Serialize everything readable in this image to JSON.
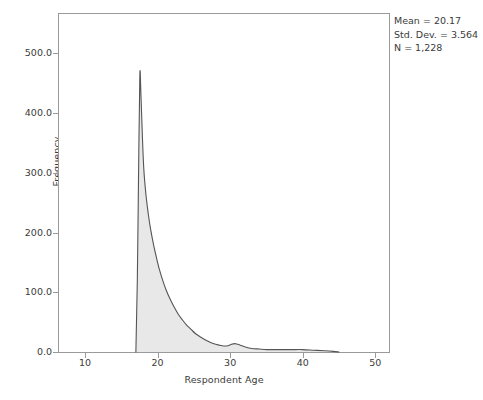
{
  "chart_data": {
    "type": "area",
    "title": "",
    "xlabel": "Respondent Age",
    "ylabel": "Frequency",
    "xlim": [
      6.4,
      51.9
    ],
    "ylim": [
      0,
      566
    ],
    "xticks": [
      "10",
      "20",
      "30",
      "40",
      "50"
    ],
    "xtick_values": [
      10,
      20,
      30,
      40,
      50
    ],
    "yticks": [
      "0.0",
      "100.0",
      "200.0",
      "300.0",
      "400.0",
      "500.0"
    ],
    "ytick_values": [
      0,
      100,
      200,
      300,
      400,
      500
    ],
    "grid": false,
    "legend": "none",
    "fill_color": "#e8e8e8",
    "line_color": "#555555",
    "frame_color": "#9a9a9a",
    "distribution": "right-skewed histogram density of respondent age, sharp mode at 17-18 with long right tail and a minor secondary bump near age 30-31",
    "x": [
      17.0,
      17.2,
      17.4,
      17.55,
      17.7,
      17.9,
      18.1,
      18.4,
      18.7,
      19.0,
      19.4,
      19.8,
      20.2,
      20.7,
      21.2,
      21.7,
      22.2,
      22.8,
      23.4,
      24.0,
      24.6,
      25.2,
      25.9,
      26.6,
      27.3,
      28.0,
      28.7,
      29.3,
      29.8,
      30.2,
      30.6,
      31.0,
      31.5,
      32.2,
      33.0,
      34.0,
      35.0,
      36.0,
      37.2,
      38.5,
      40.0,
      41.5,
      43.0,
      44.2,
      45.0
    ],
    "y": [
      0,
      120,
      330,
      467,
      430,
      360,
      305,
      262,
      232,
      208,
      182,
      160,
      140,
      120,
      103,
      89,
      77,
      64,
      54,
      45,
      38,
      31,
      25,
      20,
      16,
      13,
      11,
      10,
      11,
      13,
      14,
      13,
      11,
      8,
      6,
      5,
      4,
      4,
      4,
      4,
      4,
      3,
      2,
      1,
      0
    ]
  },
  "annotations": {
    "mean_label": "Mean = 20.17",
    "std_dev_label": "Std. Dev. = 3.564",
    "n_label": "N = 1,228"
  }
}
